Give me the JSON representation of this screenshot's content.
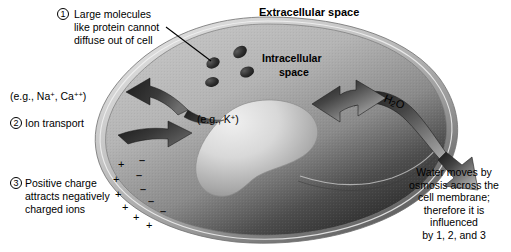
{
  "figure": {
    "background": "#ffffff"
  },
  "labels": {
    "extracellular_space": "Extracellular space",
    "intracellular_space_line1": "Intracellular",
    "intracellular_space_line2": "space",
    "h2o": "H2O",
    "eg_na_ca": "(e.g., Na+, Ca++)",
    "eg_k": "(e.g., K+)"
  },
  "annotations": [
    {
      "number": "1",
      "lines": [
        "Large molecules",
        "like protein cannot",
        "diffuse out of cell"
      ]
    },
    {
      "number": "2",
      "lines": [
        "Ion transport"
      ]
    },
    {
      "number": "3",
      "lines": [
        "Positive charge",
        "attracts negatively",
        "charged ions"
      ]
    }
  ],
  "water_note": {
    "lines": [
      "Water moves by",
      "osmosis across the",
      "cell membrane;",
      "therefore it is",
      "influenced",
      "by 1, 2, and 3"
    ]
  },
  "charges": {
    "positive_symbol": "+",
    "negative_symbol": "–",
    "positive_count": 6,
    "negative_count": 5
  },
  "colors": {
    "membrane_outer": "#b9b9b9",
    "membrane_inner": "#8f8f8f",
    "cytoplasm_light": "#c9c9c9",
    "cytoplasm_dark": "#3a3a3a",
    "nucleus_light": "#e2e2e2",
    "nucleus_dark": "#8a8a8a",
    "protein_blob": "#2b2b2b",
    "arrow_fill": "#2f2f2f",
    "text": "#000000",
    "background": "#ffffff"
  },
  "elements": {
    "protein_blob_count": 4,
    "arrow_ion_out_label": "ion efflux arrow",
    "arrow_ion_in_label": "ion influx arrow",
    "arrow_water_label": "water double arrow",
    "leader_line_label": "protein leader line"
  }
}
